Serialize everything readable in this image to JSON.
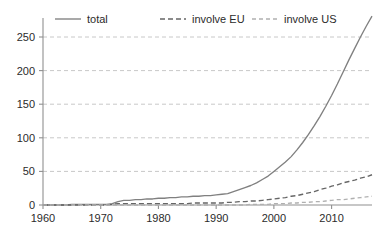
{
  "chart_data": {
    "type": "line",
    "title": "",
    "subtitle": "",
    "xlabel": "",
    "ylabel": "",
    "xlim": [
      1960,
      2017
    ],
    "ylim": [
      0,
      285
    ],
    "xticks": [
      1960,
      1970,
      1980,
      1990,
      2000,
      2010
    ],
    "yticks": [
      0,
      50,
      100,
      150,
      200,
      250
    ],
    "xtick_labels": [
      "1960",
      "1970",
      "1980",
      "1990",
      "2000",
      "2010"
    ],
    "ytick_labels": [
      "0",
      "50",
      "100",
      "150",
      "200",
      "250"
    ],
    "grid": "horizontal-dashed",
    "legend_position": "top",
    "x": [
      1960,
      1961,
      1962,
      1963,
      1964,
      1965,
      1966,
      1967,
      1968,
      1969,
      1970,
      1971,
      1972,
      1973,
      1974,
      1975,
      1976,
      1977,
      1978,
      1979,
      1980,
      1981,
      1982,
      1983,
      1984,
      1985,
      1986,
      1987,
      1988,
      1989,
      1990,
      1991,
      1992,
      1993,
      1994,
      1995,
      1996,
      1997,
      1998,
      1999,
      2000,
      2001,
      2002,
      2003,
      2004,
      2005,
      2006,
      2007,
      2008,
      2009,
      2010,
      2011,
      2012,
      2013,
      2014,
      2015,
      2016,
      2017
    ],
    "series": [
      {
        "name": "total",
        "style": "solid",
        "color": "#808080",
        "values": [
          0,
          0,
          0,
          0,
          0,
          1,
          1,
          1,
          1,
          1,
          1,
          1,
          2,
          5,
          7,
          7,
          8,
          8,
          9,
          9,
          10,
          10,
          11,
          11,
          12,
          12,
          13,
          13,
          14,
          14,
          15,
          16,
          17,
          20,
          23,
          26,
          29,
          33,
          38,
          43,
          50,
          57,
          64,
          72,
          82,
          93,
          105,
          118,
          132,
          147,
          163,
          180,
          198,
          216,
          233,
          250,
          266,
          281
        ]
      },
      {
        "name": "involve EU",
        "style": "dashed",
        "color": "#666666",
        "values": [
          0,
          0,
          0,
          0,
          0,
          0,
          0,
          0,
          0,
          0,
          0,
          0,
          1,
          2,
          2,
          2,
          2,
          2,
          2,
          2,
          2,
          2,
          2,
          2,
          2,
          2,
          3,
          3,
          3,
          3,
          3,
          3,
          4,
          4,
          5,
          5,
          6,
          6,
          7,
          8,
          9,
          10,
          11,
          13,
          14,
          16,
          18,
          20,
          23,
          25,
          28,
          30,
          33,
          35,
          37,
          40,
          42,
          45
        ]
      },
      {
        "name": "involve US",
        "style": "dotted-dashed",
        "color": "#b0b0b0",
        "values": [
          0,
          0,
          0,
          0,
          0,
          0,
          0,
          0,
          0,
          0,
          0,
          0,
          0,
          0,
          0,
          0,
          0,
          0,
          0,
          0,
          0,
          0,
          0,
          0,
          0,
          0,
          0,
          0,
          0,
          0,
          0,
          0,
          0,
          0,
          0,
          0,
          1,
          1,
          1,
          1,
          2,
          2,
          2,
          3,
          3,
          4,
          4,
          5,
          5,
          6,
          7,
          8,
          8,
          9,
          10,
          11,
          12,
          13
        ]
      }
    ]
  },
  "legend": {
    "items": [
      {
        "label": "total",
        "style": "solid",
        "color": "#808080"
      },
      {
        "label": "involve EU",
        "style": "dashed",
        "color": "#666666"
      },
      {
        "label": "involve US",
        "style": "dotted-dashed",
        "color": "#b0b0b0"
      }
    ]
  },
  "colors": {
    "background": "#ffffff",
    "axis": "#909090",
    "grid": "#c8c8c8",
    "text": "#2b2b2b",
    "total": "#808080",
    "involve_eu": "#666666",
    "involve_us": "#b0b0b0"
  }
}
